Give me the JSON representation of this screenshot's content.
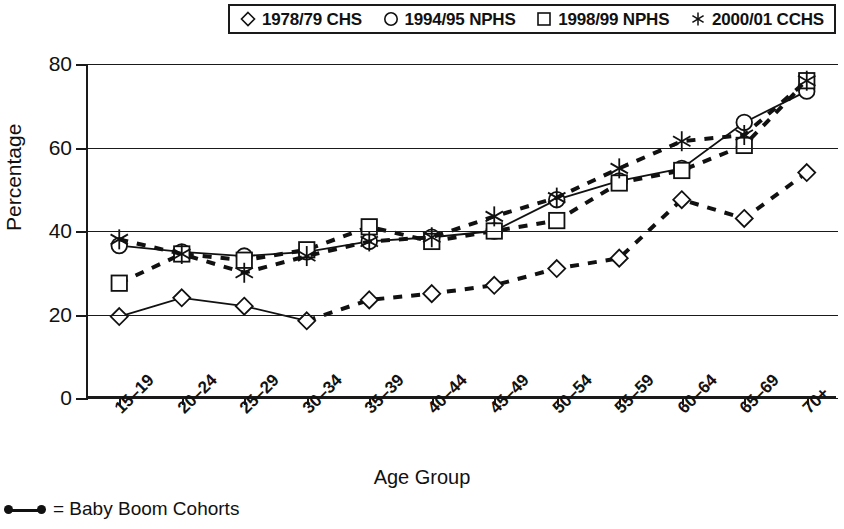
{
  "legend": {
    "items": [
      {
        "marker": "diamond-icon",
        "label": "1978/79 CHS"
      },
      {
        "marker": "circle-icon",
        "label": "1994/95 NPHS"
      },
      {
        "marker": "square-icon",
        "label": "1998/99 NPHS"
      },
      {
        "marker": "asterisk-icon",
        "label": "2000/01 CCHS"
      }
    ]
  },
  "footnote": {
    "symbol": "baby-boom-line-icon",
    "text": "= Baby Boom Cohorts"
  },
  "chart_data": {
    "type": "line",
    "title": "",
    "xlabel": "Age Group",
    "ylabel": "Percentage",
    "ylim": [
      0,
      80
    ],
    "yticks": [
      0,
      20,
      40,
      60,
      80
    ],
    "grid": true,
    "legend_position": "top",
    "categories": [
      "15–19",
      "20–24",
      "25–29",
      "30–34",
      "35–39",
      "40–44",
      "45–49",
      "50–54",
      "55–59",
      "60–64",
      "65–69",
      "70+"
    ],
    "series": [
      {
        "name": "1978/79 CHS",
        "marker": "diamond",
        "line": "mixed-solid-dashed",
        "values": [
          19.5,
          24.0,
          22.0,
          18.5,
          23.5,
          25.0,
          27.0,
          31.0,
          33.5,
          47.5,
          43.0,
          54.0
        ]
      },
      {
        "name": "1994/95 NPHS",
        "marker": "circle",
        "line": "solid",
        "values": [
          36.5,
          35.0,
          34.0,
          35.0,
          37.5,
          38.5,
          40.0,
          47.5,
          52.0,
          55.0,
          66.0,
          73.5
        ]
      },
      {
        "name": "1998/99 NPHS",
        "marker": "square",
        "line": "dashed",
        "values": [
          27.5,
          34.5,
          33.0,
          35.5,
          41.0,
          37.5,
          40.0,
          42.5,
          51.5,
          54.5,
          60.5,
          76.0
        ]
      },
      {
        "name": "2000/01 CCHS",
        "marker": "asterisk",
        "line": "dashed",
        "values": [
          38.0,
          34.5,
          30.0,
          34.0,
          37.5,
          38.5,
          43.5,
          48.0,
          55.0,
          61.5,
          63.0,
          76.0
        ]
      }
    ]
  }
}
